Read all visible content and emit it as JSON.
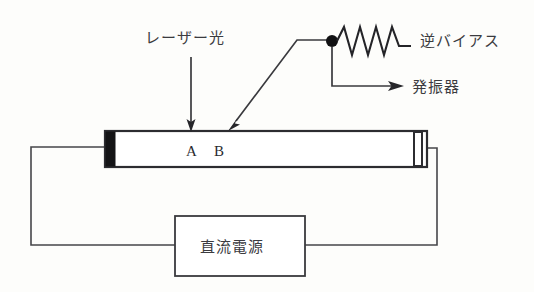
{
  "figure": {
    "background_color": "#fdfdfb",
    "ink_color": "#2c2c30"
  },
  "labels": {
    "laser_light": "レーザー光",
    "reverse_bias": "逆バイアス",
    "oscillator": "発振器",
    "dc_power_supply": "直流電源",
    "point_a": "A",
    "point_b": "B"
  },
  "components": {
    "laser_tube": {
      "name": "laser-tube",
      "left_mirror": "filled-mirror",
      "right_mirror": "open-mirror"
    },
    "resistor": {
      "name": "zigzag-resistor",
      "peaks": 4
    },
    "junction": {
      "name": "junction-dot"
    },
    "power_supply_box": {
      "name": "dc-power-supply-box"
    }
  },
  "arrows": {
    "laser_beam_arrow": "down-arrow",
    "detector_pointer_arrow": "diagonal-arrow",
    "oscillator_arrow": "right-arrow"
  }
}
